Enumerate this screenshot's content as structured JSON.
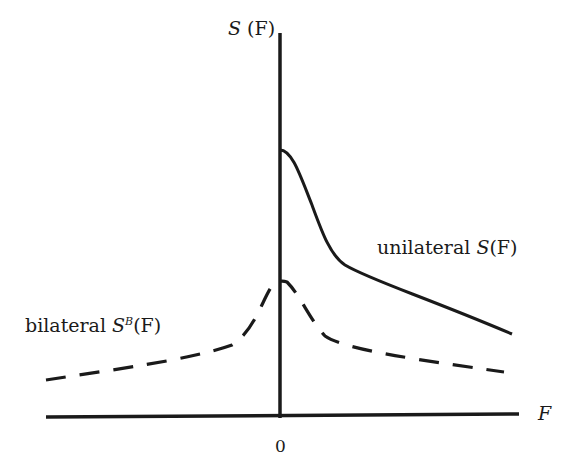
{
  "figure": {
    "y_axis_label": {
      "prefix": "S",
      "suffix": "(F)"
    },
    "x_axis_label": "F",
    "origin_label": "0",
    "curves": [
      {
        "name": "unilateral",
        "label_word": "unilateral",
        "label_symbol": "S",
        "label_arg": "(F)",
        "style": "solid"
      },
      {
        "name": "bilateral",
        "label_word": "bilateral",
        "label_symbol": "S",
        "label_sup": "B",
        "label_arg": "(F)",
        "style": "dashed"
      }
    ],
    "colors": {
      "ink": "#1a1a1a",
      "background": "#ffffff"
    }
  }
}
